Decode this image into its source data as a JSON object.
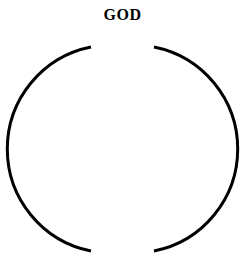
{
  "diagram": {
    "title": "GOD",
    "shape": "circle-with-gaps",
    "stroke_color": "#000000",
    "background_color": "#ffffff"
  }
}
